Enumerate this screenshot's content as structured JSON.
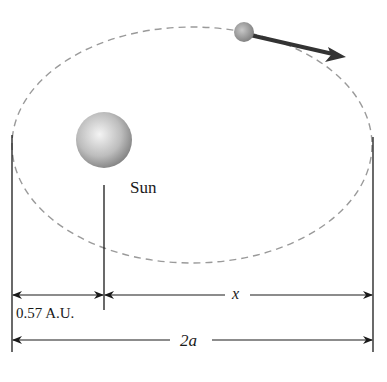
{
  "diagram": {
    "labels": {
      "sun": "Sun",
      "perihelion_distance": "0.57 A.U.",
      "x": "x",
      "major_axis": "2a"
    },
    "colors": {
      "orbit": "#9a9a9a",
      "lines": "#1a1a1a",
      "sun_light": "#f0f0f0",
      "sun_dark": "#8a8a8a",
      "comet": "#9a9a9a",
      "arrow": "#333333"
    }
  }
}
